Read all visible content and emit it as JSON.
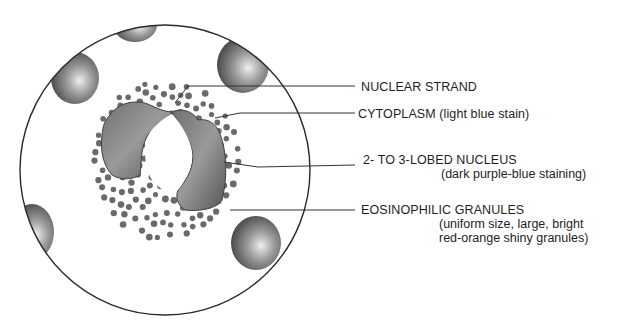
{
  "diagram": {
    "subject": "Eosinophil",
    "labels": [
      {
        "id": "nuclear-strand",
        "title": "NUCLEAR STRAND",
        "note": []
      },
      {
        "id": "cytoplasm",
        "title": "CYTOPLASM (light blue stain)",
        "note": []
      },
      {
        "id": "nucleus",
        "title": "2- TO 3-LOBED NUCLEUS",
        "note": [
          "(dark purple-blue staining)"
        ]
      },
      {
        "id": "granules",
        "title": "EOSINOPHILIC GRANULES",
        "note": [
          "(uniform size, large, bright",
          "red-orange shiny granules)"
        ]
      }
    ],
    "colors": {
      "outline": "#2a2a2a",
      "granule": "#6a6a6a",
      "nucleus": "#5c5c5c",
      "rbc": "#555555",
      "text": "#1e1e1e"
    }
  }
}
